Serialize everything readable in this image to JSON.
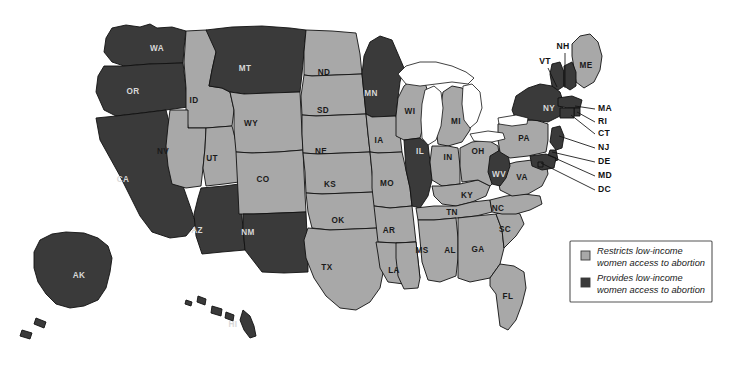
{
  "map": {
    "title": "US states abortion access for low-income women",
    "colors": {
      "restricts": "#a8a8a8",
      "provides": "#3a3a3a",
      "outline": "#111111",
      "water": "#ffffff",
      "background": "#ffffff",
      "label_on_dark": "#d8d8d8",
      "label_on_light": "#1a1a1a"
    },
    "states": [
      {
        "code": "WA",
        "status": "provides",
        "lx": 157,
        "ly": 49
      },
      {
        "code": "OR",
        "status": "provides",
        "lx": 133,
        "ly": 92
      },
      {
        "code": "CA",
        "status": "provides",
        "lx": 123,
        "ly": 180
      },
      {
        "code": "ID",
        "status": "restricts",
        "lx": 194,
        "ly": 101
      },
      {
        "code": "NV",
        "status": "restricts",
        "lx": 163,
        "ly": 152
      },
      {
        "code": "UT",
        "status": "restricts",
        "lx": 212,
        "ly": 159
      },
      {
        "code": "AZ",
        "status": "provides",
        "lx": 197,
        "ly": 231
      },
      {
        "code": "MT",
        "status": "provides",
        "lx": 245,
        "ly": 69
      },
      {
        "code": "WY",
        "status": "restricts",
        "lx": 251,
        "ly": 124
      },
      {
        "code": "CO",
        "status": "restricts",
        "lx": 263,
        "ly": 180
      },
      {
        "code": "NM",
        "status": "provides",
        "lx": 248,
        "ly": 233
      },
      {
        "code": "ND",
        "status": "restricts",
        "lx": 324,
        "ly": 73
      },
      {
        "code": "SD",
        "status": "restricts",
        "lx": 323,
        "ly": 111
      },
      {
        "code": "NE",
        "status": "restricts",
        "lx": 321,
        "ly": 152
      },
      {
        "code": "KS",
        "status": "restricts",
        "lx": 330,
        "ly": 185
      },
      {
        "code": "OK",
        "status": "restricts",
        "lx": 338,
        "ly": 221
      },
      {
        "code": "TX",
        "status": "restricts",
        "lx": 327,
        "ly": 268
      },
      {
        "code": "MN",
        "status": "provides",
        "lx": 371,
        "ly": 94
      },
      {
        "code": "IA",
        "status": "restricts",
        "lx": 379,
        "ly": 141
      },
      {
        "code": "MO",
        "status": "restricts",
        "lx": 387,
        "ly": 184
      },
      {
        "code": "AR",
        "status": "restricts",
        "lx": 389,
        "ly": 231
      },
      {
        "code": "LA",
        "status": "restricts",
        "lx": 394,
        "ly": 271
      },
      {
        "code": "WI",
        "status": "restricts",
        "lx": 410,
        "ly": 112
      },
      {
        "code": "IL",
        "status": "provides",
        "lx": 420,
        "ly": 152
      },
      {
        "code": "MS",
        "status": "restricts",
        "lx": 422,
        "ly": 251
      },
      {
        "code": "MI",
        "status": "restricts",
        "lx": 456,
        "ly": 122
      },
      {
        "code": "IN",
        "status": "restricts",
        "lx": 448,
        "ly": 158
      },
      {
        "code": "KY",
        "status": "restricts",
        "lx": 467,
        "ly": 196
      },
      {
        "code": "TN",
        "status": "restricts",
        "lx": 452,
        "ly": 213
      },
      {
        "code": "AL",
        "status": "restricts",
        "lx": 450,
        "ly": 251
      },
      {
        "code": "OH",
        "status": "restricts",
        "lx": 478,
        "ly": 152
      },
      {
        "code": "GA",
        "status": "restricts",
        "lx": 478,
        "ly": 250
      },
      {
        "code": "FL",
        "status": "restricts",
        "lx": 508,
        "ly": 297
      },
      {
        "code": "SC",
        "status": "restricts",
        "lx": 505,
        "ly": 230
      },
      {
        "code": "NC",
        "status": "restricts",
        "lx": 498,
        "ly": 209
      },
      {
        "code": "VA",
        "status": "restricts",
        "lx": 522,
        "ly": 178
      },
      {
        "code": "WV",
        "status": "provides",
        "lx": 499,
        "ly": 175
      },
      {
        "code": "PA",
        "status": "restricts",
        "lx": 524,
        "ly": 139
      },
      {
        "code": "NY",
        "status": "provides",
        "lx": 549,
        "ly": 109
      },
      {
        "code": "ME",
        "status": "restricts",
        "lx": 586,
        "ly": 66
      },
      {
        "code": "AK",
        "status": "provides",
        "lx": 79,
        "ly": 276
      },
      {
        "code": "HI",
        "status": "provides",
        "lx": 233,
        "ly": 325
      }
    ],
    "callouts": [
      {
        "code": "VT",
        "status": "provides",
        "tx": 545,
        "ty": 62,
        "ax": 548,
        "ay": 68,
        "bx": 557,
        "by": 87
      },
      {
        "code": "NH",
        "status": "provides",
        "tx": 563,
        "ty": 47,
        "ax": 565,
        "ay": 53,
        "bx": 565,
        "by": 88
      },
      {
        "code": "MA",
        "status": "provides",
        "tx": 598,
        "ty": 109,
        "ax": 595,
        "ay": 109,
        "bx": 575,
        "by": 106
      },
      {
        "code": "RI",
        "status": "provides",
        "tx": 598,
        "ty": 122,
        "ax": 595,
        "ay": 122,
        "bx": 577,
        "by": 112
      },
      {
        "code": "CT",
        "status": "provides",
        "tx": 598,
        "ty": 134,
        "ax": 595,
        "ay": 134,
        "bx": 571,
        "by": 115
      },
      {
        "code": "NJ",
        "status": "provides",
        "tx": 598,
        "ty": 148,
        "ax": 595,
        "ay": 148,
        "bx": 559,
        "by": 136
      },
      {
        "code": "DE",
        "status": "provides",
        "tx": 598,
        "ty": 162,
        "ax": 595,
        "ay": 162,
        "bx": 552,
        "by": 152
      },
      {
        "code": "MD",
        "status": "provides",
        "tx": 598,
        "ty": 176,
        "ax": 595,
        "ay": 176,
        "bx": 548,
        "by": 155
      },
      {
        "code": "DC",
        "status": "provides",
        "tx": 598,
        "ty": 190,
        "ax": 595,
        "ay": 190,
        "bx": 541,
        "by": 163
      }
    ],
    "legend": {
      "items": [
        {
          "swatch": "restricts",
          "line1": "Restricts low-income",
          "line2": "women access to abortion"
        },
        {
          "swatch": "provides",
          "line1": "Provides low-income",
          "line2": "women access to abortion"
        }
      ]
    }
  }
}
